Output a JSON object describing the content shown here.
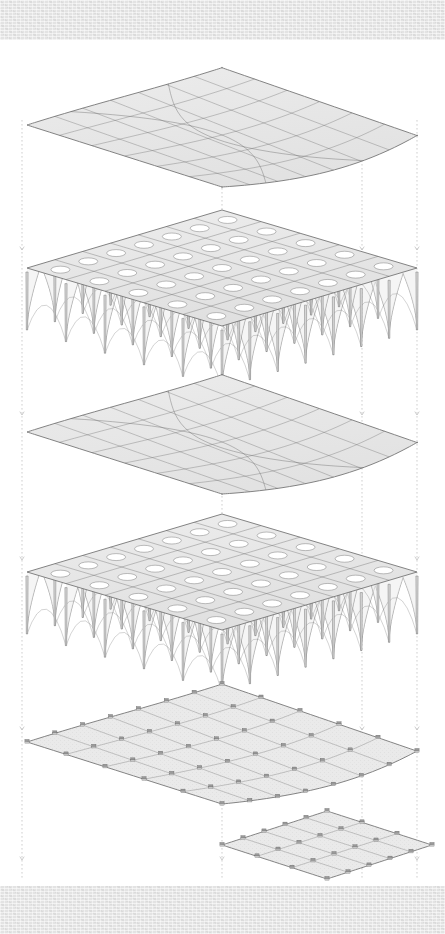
{
  "sheet": {
    "title": "Exploded Axonometric — Layered Vault Structure",
    "width": 445,
    "height": 934,
    "paper_color": "#ffffff",
    "band_color": "#e3e3e3",
    "line_color": "#6f6f6f",
    "fill_color": "#e9e9e9",
    "dash_color": "#b9b9b9"
  },
  "drawing": {
    "type": "exploded-axonometric",
    "projection": "axonometric",
    "layer_count": 6,
    "layers": [
      {
        "id": "roof-shell",
        "name": "Upper Curved Roof Shell",
        "order": 1,
        "kind": "shell",
        "center_y": 125,
        "half_w": 195,
        "half_d": 62,
        "sag": 30,
        "grid_u": 7,
        "grid_v": 6
      },
      {
        "id": "vault-grid-upper",
        "name": "Upper Groin Vault Grid",
        "order": 2,
        "kind": "vaults",
        "center_y": 268,
        "half_w": 195,
        "half_d": 58,
        "bays_x": 7,
        "bays_y": 5,
        "pier_height": 62
      },
      {
        "id": "floor-shell",
        "name": "Intermediate Curved Floor Shell",
        "order": 3,
        "kind": "shell",
        "center_y": 432,
        "half_w": 195,
        "half_d": 62,
        "sag": 30,
        "grid_u": 7,
        "grid_v": 6
      },
      {
        "id": "vault-grid-lower",
        "name": "Lower Groin Vault Grid",
        "order": 4,
        "kind": "vaults",
        "center_y": 572,
        "half_w": 195,
        "half_d": 58,
        "bays_x": 7,
        "bays_y": 5,
        "pier_height": 62
      },
      {
        "id": "ground-slab",
        "name": "Ground Slab with Footings",
        "order": 5,
        "kind": "footing-plane",
        "center_y": 742,
        "half_w": 195,
        "half_d": 62,
        "sag": 26,
        "grid_u": 7,
        "grid_v": 5
      },
      {
        "id": "foundation-slab",
        "name": "Lower Foundation Slab",
        "order": 6,
        "kind": "footing-plane",
        "center_y": 845,
        "half_w": 105,
        "half_d": 34,
        "sag": 0,
        "grid_u": 5,
        "grid_v": 3,
        "offset_x": 105
      }
    ],
    "alignment_lines": {
      "name": "dashed-alignment-guides",
      "style": "dotted",
      "color": "#b9b9b9",
      "x_positions": [
        22,
        222,
        362,
        417
      ],
      "arrow_heads": true
    }
  }
}
